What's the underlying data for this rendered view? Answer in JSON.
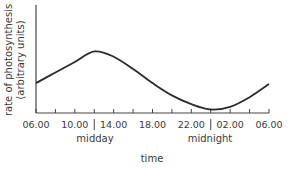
{
  "chart_data": {
    "type": "line",
    "title": "",
    "xlabel": "time",
    "ylabel": "rate of photosynthesis (arbitrary units)",
    "ylabel_lines": [
      "rate of photosynthesis",
      "(arbitrary units)"
    ],
    "x_tick_labels": [
      "06.00",
      "10.00",
      "14.00",
      "18.00",
      "22.00",
      "02.00",
      "06.00"
    ],
    "x_tick_hours": [
      0,
      4,
      8,
      12,
      16,
      20,
      24
    ],
    "minor_tick_count": 13,
    "annotations": [
      {
        "text": "midday",
        "hour": 6
      },
      {
        "text": "midnight",
        "hour": 18
      }
    ],
    "grid": false,
    "y_ticks": false,
    "series": [
      {
        "name": "rate of photosynthesis",
        "x_hours": [
          0,
          2,
          4,
          6,
          8,
          10,
          12,
          14,
          16,
          18,
          20,
          22,
          24
        ],
        "values": [
          0.34,
          0.46,
          0.58,
          0.7,
          0.64,
          0.5,
          0.34,
          0.2,
          0.1,
          0.04,
          0.07,
          0.18,
          0.33
        ]
      }
    ],
    "ylim": [
      0,
      1
    ]
  },
  "labels": {
    "ylabel_line1": "rate of photosynthesis",
    "ylabel_line2": "(arbitrary units)",
    "xlabel": "time",
    "midday": "midday",
    "midnight": "midnight",
    "ticks": [
      "06.00",
      "10.00",
      "14.00",
      "18.00",
      "22.00",
      "02.00",
      "06.00"
    ]
  }
}
